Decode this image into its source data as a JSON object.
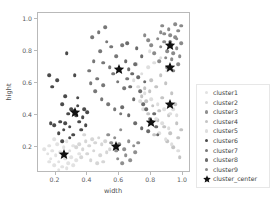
{
  "chart_data": {
    "type": "scatter",
    "title": "",
    "xlabel": "width",
    "ylabel": "hight",
    "xlim": [
      0.09,
      1.05
    ],
    "ylim": [
      0.04,
      1.04
    ],
    "xticks": [
      "0.2",
      "0.4",
      "0.6",
      "0.8",
      "1.0"
    ],
    "xtick_values": [
      0.2,
      0.4,
      0.6,
      0.8,
      1.0
    ],
    "yticks": [
      "0.2",
      "0.4",
      "0.6",
      "0.8",
      "1.0"
    ],
    "ytick_values": [
      0.2,
      0.4,
      0.6,
      0.8,
      1.0
    ],
    "grid": false,
    "legend_position": "right outside",
    "marker_size": 3.6,
    "series": [
      {
        "name": "cluster1",
        "color": "#e2e2e2",
        "points": [
          [
            0.13,
            0.19
          ],
          [
            0.15,
            0.16
          ],
          [
            0.16,
            0.21
          ],
          [
            0.17,
            0.13
          ],
          [
            0.18,
            0.18
          ],
          [
            0.19,
            0.09
          ],
          [
            0.2,
            0.15
          ],
          [
            0.21,
            0.22
          ],
          [
            0.22,
            0.11
          ],
          [
            0.23,
            0.17
          ],
          [
            0.24,
            0.08
          ],
          [
            0.25,
            0.2
          ],
          [
            0.26,
            0.13
          ],
          [
            0.27,
            0.24
          ],
          [
            0.28,
            0.1
          ],
          [
            0.29,
            0.18
          ],
          [
            0.3,
            0.14
          ],
          [
            0.31,
            0.21
          ],
          [
            0.33,
            0.12
          ],
          [
            0.35,
            0.16
          ],
          [
            0.19,
            0.25
          ],
          [
            0.22,
            0.06
          ],
          [
            0.27,
            0.07
          ],
          [
            0.31,
            0.09
          ],
          [
            0.16,
            0.11
          ]
        ]
      },
      {
        "name": "cluster2",
        "color": "#d6d6d6",
        "points": [
          [
            0.33,
            0.2
          ],
          [
            0.35,
            0.22
          ],
          [
            0.37,
            0.19
          ],
          [
            0.39,
            0.24
          ],
          [
            0.41,
            0.21
          ],
          [
            0.43,
            0.25
          ],
          [
            0.45,
            0.23
          ],
          [
            0.47,
            0.26
          ],
          [
            0.49,
            0.22
          ],
          [
            0.51,
            0.24
          ],
          [
            0.36,
            0.14
          ],
          [
            0.4,
            0.16
          ],
          [
            0.44,
            0.18
          ],
          [
            0.48,
            0.15
          ],
          [
            0.52,
            0.17
          ],
          [
            0.42,
            0.12
          ],
          [
            0.46,
            0.1
          ],
          [
            0.38,
            0.28
          ],
          [
            0.5,
            0.11
          ],
          [
            0.54,
            0.19
          ]
        ]
      },
      {
        "name": "cluster3",
        "color": "#8f8f8f",
        "points": [
          [
            0.57,
            0.26
          ],
          [
            0.6,
            0.22
          ],
          [
            0.63,
            0.19
          ],
          [
            0.66,
            0.24
          ],
          [
            0.69,
            0.21
          ],
          [
            0.61,
            0.31
          ],
          [
            0.64,
            0.15
          ],
          [
            0.58,
            0.18
          ],
          [
            0.72,
            0.23
          ],
          [
            0.55,
            0.23
          ],
          [
            0.67,
            0.12
          ],
          [
            0.7,
            0.17
          ],
          [
            0.53,
            0.28
          ],
          [
            0.62,
            0.1
          ],
          [
            0.59,
            0.13
          ]
        ]
      },
      {
        "name": "cluster4",
        "color": "#c4c4c4",
        "points": [
          [
            0.74,
            0.52
          ],
          [
            0.77,
            0.49
          ],
          [
            0.79,
            0.55
          ],
          [
            0.81,
            0.46
          ],
          [
            0.83,
            0.58
          ],
          [
            0.85,
            0.43
          ],
          [
            0.87,
            0.51
          ],
          [
            0.89,
            0.6
          ],
          [
            0.91,
            0.4
          ],
          [
            0.93,
            0.54
          ],
          [
            0.95,
            0.47
          ],
          [
            0.8,
            0.62
          ],
          [
            0.84,
            0.37
          ],
          [
            0.88,
            0.33
          ],
          [
            0.92,
            0.29
          ],
          [
            0.96,
            0.35
          ],
          [
            0.78,
            0.41
          ],
          [
            0.86,
            0.65
          ],
          [
            0.9,
            0.24
          ],
          [
            0.94,
            0.2
          ],
          [
            0.97,
            0.26
          ],
          [
            0.99,
            0.31
          ],
          [
            0.82,
            0.28
          ],
          [
            0.76,
            0.57
          ],
          [
            0.98,
            0.14
          ]
        ]
      },
      {
        "name": "cluster5",
        "color": "#dedede",
        "points": [
          [
            0.69,
            0.62
          ],
          [
            0.72,
            0.58
          ],
          [
            0.74,
            0.66
          ],
          [
            0.76,
            0.54
          ],
          [
            0.78,
            0.7
          ],
          [
            0.8,
            0.5
          ],
          [
            0.82,
            0.73
          ],
          [
            0.84,
            0.47
          ],
          [
            0.86,
            0.76
          ],
          [
            0.88,
            0.44
          ],
          [
            0.9,
            0.68
          ],
          [
            0.92,
            0.41
          ],
          [
            0.71,
            0.72
          ],
          [
            0.75,
            0.44
          ],
          [
            0.79,
            0.8
          ],
          [
            0.83,
            0.38
          ],
          [
            0.87,
            0.35
          ],
          [
            0.91,
            0.32
          ],
          [
            0.94,
            0.44
          ],
          [
            0.96,
            0.4
          ],
          [
            0.73,
            0.49
          ],
          [
            0.85,
            0.29
          ],
          [
            0.89,
            0.25
          ],
          [
            0.93,
            0.22
          ],
          [
            0.97,
            0.18
          ]
        ]
      },
      {
        "name": "cluster6",
        "color": "#4a4a4a",
        "points": [
          [
            0.16,
            0.65
          ],
          [
            0.18,
            0.58
          ],
          [
            0.21,
            0.62
          ],
          [
            0.24,
            0.47
          ],
          [
            0.26,
            0.52
          ],
          [
            0.28,
            0.41
          ],
          [
            0.3,
            0.44
          ],
          [
            0.31,
            0.43
          ],
          [
            0.32,
            0.42
          ],
          [
            0.33,
            0.4
          ],
          [
            0.34,
            0.46
          ],
          [
            0.27,
            0.79
          ],
          [
            0.32,
            0.65
          ],
          [
            0.23,
            0.36
          ],
          [
            0.26,
            0.35
          ],
          [
            0.17,
            0.35
          ],
          [
            0.19,
            0.34
          ],
          [
            0.29,
            0.33
          ],
          [
            0.35,
            0.36
          ],
          [
            0.37,
            0.39
          ],
          [
            0.22,
            0.29
          ],
          [
            0.25,
            0.31
          ],
          [
            0.31,
            0.28
          ],
          [
            0.36,
            0.31
          ],
          [
            0.39,
            0.34
          ],
          [
            0.34,
            0.51
          ],
          [
            0.38,
            0.44
          ],
          [
            0.4,
            0.42
          ],
          [
            0.29,
            0.26
          ],
          [
            0.24,
            0.24
          ]
        ]
      },
      {
        "name": "cluster7",
        "color": "#777777",
        "points": [
          [
            0.41,
            0.68
          ],
          [
            0.44,
            0.74
          ],
          [
            0.46,
            0.63
          ],
          [
            0.48,
            0.8
          ],
          [
            0.5,
            0.59
          ],
          [
            0.52,
            0.86
          ],
          [
            0.54,
            0.7
          ],
          [
            0.56,
            0.66
          ],
          [
            0.58,
            0.77
          ],
          [
            0.6,
            0.69
          ],
          [
            0.43,
            0.89
          ],
          [
            0.47,
            0.92
          ],
          [
            0.51,
            0.95
          ],
          [
            0.55,
            0.83
          ],
          [
            0.59,
            0.61
          ],
          [
            0.45,
            0.55
          ],
          [
            0.49,
            0.5
          ],
          [
            0.53,
            0.47
          ],
          [
            0.57,
            0.44
          ],
          [
            0.61,
            0.41
          ],
          [
            0.42,
            0.6
          ],
          [
            0.5,
            0.73
          ],
          [
            0.63,
            0.57
          ],
          [
            0.65,
            0.63
          ],
          [
            0.62,
            0.84
          ]
        ]
      },
      {
        "name": "cluster8",
        "color": "#6b6b6b",
        "points": [
          [
            0.66,
            0.69
          ],
          [
            0.68,
            0.66
          ],
          [
            0.7,
            0.72
          ],
          [
            0.72,
            0.64
          ],
          [
            0.74,
            0.77
          ],
          [
            0.76,
            0.61
          ],
          [
            0.64,
            0.74
          ],
          [
            0.67,
            0.58
          ],
          [
            0.71,
            0.82
          ],
          [
            0.73,
            0.55
          ],
          [
            0.69,
            0.5
          ],
          [
            0.75,
            0.47
          ],
          [
            0.77,
            0.44
          ],
          [
            0.79,
            0.38
          ],
          [
            0.81,
            0.36
          ],
          [
            0.8,
            0.36
          ],
          [
            0.83,
            0.33
          ],
          [
            0.78,
            0.3
          ],
          [
            0.82,
            0.41
          ],
          [
            0.84,
            0.28
          ],
          [
            0.65,
            0.85
          ],
          [
            0.62,
            0.45
          ],
          [
            0.66,
            0.4
          ],
          [
            0.7,
            0.35
          ],
          [
            0.74,
            0.32
          ]
        ]
      },
      {
        "name": "cluster9",
        "color": "#8a8a8a",
        "points": [
          [
            0.84,
            0.88
          ],
          [
            0.86,
            0.83
          ],
          [
            0.88,
            0.91
          ],
          [
            0.9,
            0.8
          ],
          [
            0.92,
            0.86
          ],
          [
            0.93,
            0.84
          ],
          [
            0.94,
            0.79
          ],
          [
            0.95,
            0.89
          ],
          [
            0.96,
            0.82
          ],
          [
            0.97,
            0.93
          ],
          [
            0.98,
            0.77
          ],
          [
            0.99,
            0.85
          ],
          [
            0.91,
            0.94
          ],
          [
            0.89,
            0.76
          ],
          [
            0.87,
            0.96
          ],
          [
            0.85,
            0.74
          ],
          [
            0.93,
            0.75
          ],
          [
            0.95,
            0.97
          ],
          [
            0.97,
            0.72
          ],
          [
            0.99,
            0.96
          ],
          [
            0.8,
            0.84
          ],
          [
            0.82,
            0.79
          ],
          [
            0.78,
            0.87
          ],
          [
            0.76,
            0.9
          ],
          [
            0.9,
            0.7
          ],
          [
            0.94,
            0.68
          ],
          [
            0.96,
            0.88
          ],
          [
            0.92,
            0.9
          ],
          [
            0.88,
            0.86
          ],
          [
            0.86,
            0.92
          ]
        ]
      }
    ],
    "centers": {
      "name": "cluster_center",
      "color": "#111111",
      "points": [
        [
          0.25,
          0.16
        ],
        [
          0.32,
          0.42
        ],
        [
          0.58,
          0.21
        ],
        [
          0.6,
          0.69
        ],
        [
          0.8,
          0.36
        ],
        [
          0.92,
          0.47
        ],
        [
          0.92,
          0.7
        ],
        [
          0.92,
          0.84
        ]
      ]
    }
  },
  "legend": {
    "entries": [
      {
        "label": "cluster1",
        "color": "#e2e2e2",
        "marker": "circle"
      },
      {
        "label": "cluster2",
        "color": "#d6d6d6",
        "marker": "circle"
      },
      {
        "label": "cluster3",
        "color": "#8f8f8f",
        "marker": "circle"
      },
      {
        "label": "cluster4",
        "color": "#c4c4c4",
        "marker": "circle"
      },
      {
        "label": "cluster5",
        "color": "#dedede",
        "marker": "circle"
      },
      {
        "label": "cluster6",
        "color": "#4a4a4a",
        "marker": "circle"
      },
      {
        "label": "cluster7",
        "color": "#777777",
        "marker": "circle"
      },
      {
        "label": "cluster8",
        "color": "#6b6b6b",
        "marker": "circle"
      },
      {
        "label": "cluster9",
        "color": "#8a8a8a",
        "marker": "circle"
      },
      {
        "label": "cluster_center",
        "color": "#111111",
        "marker": "star"
      }
    ]
  },
  "style": {
    "background": "#ffffff",
    "axis_color": "#b9b9b9",
    "tick_label_color": "#59595b",
    "axis_label_color": "#4d4d4f",
    "legend_border": "#e7e7e7"
  }
}
